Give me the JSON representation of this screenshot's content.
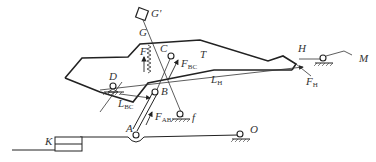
{
  "diagram": {
    "type": "mechanism-force-diagram",
    "labels": {
      "G_prime": "G'",
      "G": "G",
      "C": "C",
      "T": "T",
      "F": "F",
      "F_BC": "F",
      "F_BC_sub": "BC",
      "H": "H",
      "M": "M",
      "D": "D",
      "L_H": "L",
      "L_H_sub": "H",
      "F_H": "F",
      "F_H_sub": "H",
      "L_BC": "L",
      "L_BC_sub": "BC",
      "B": "B",
      "f": "f",
      "F_AB": "F",
      "F_AB_sub": "AB",
      "A": "A",
      "O": "O",
      "K": "K"
    },
    "components": [
      {
        "id": "frame-T",
        "desc": "main body outline T"
      },
      {
        "id": "link-AB",
        "desc": "two-force link from A to B"
      },
      {
        "id": "spring-G",
        "desc": "spring between G and frame"
      },
      {
        "id": "support-D",
        "desc": "pin support at D"
      },
      {
        "id": "support-f",
        "desc": "pin support at f"
      },
      {
        "id": "support-H",
        "desc": "pin support near H"
      },
      {
        "id": "support-O",
        "desc": "pin support at O"
      },
      {
        "id": "block-K",
        "desc": "sliding block K"
      },
      {
        "id": "base-line",
        "desc": "ground line K-A-O"
      }
    ],
    "forces": [
      "F",
      "F_BC",
      "F_AB",
      "F_H"
    ],
    "dimensions": [
      "L_BC",
      "L_H"
    ]
  }
}
